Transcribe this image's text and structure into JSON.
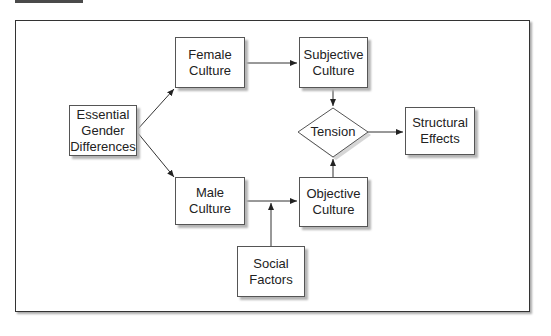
{
  "diagram": {
    "nodes": {
      "essential": {
        "label": "Essential\nGender\nDifferences"
      },
      "female": {
        "label": "Female\nCulture"
      },
      "male": {
        "label": "Male\nCulture"
      },
      "subjective": {
        "label": "Subjective\nCulture"
      },
      "objective": {
        "label": "Objective\nCulture"
      },
      "tension": {
        "label": "Tension"
      },
      "structural": {
        "label": "Structural\nEffects"
      },
      "social": {
        "label": "Social\nFactors"
      }
    },
    "edges": [
      {
        "from": "essential",
        "to": "female"
      },
      {
        "from": "essential",
        "to": "male"
      },
      {
        "from": "female",
        "to": "subjective"
      },
      {
        "from": "male",
        "to": "objective"
      },
      {
        "from": "social",
        "to": "male-objective-edge"
      },
      {
        "from": "subjective",
        "to": "tension"
      },
      {
        "from": "objective",
        "to": "tension"
      },
      {
        "from": "tension",
        "to": "structural"
      }
    ]
  }
}
